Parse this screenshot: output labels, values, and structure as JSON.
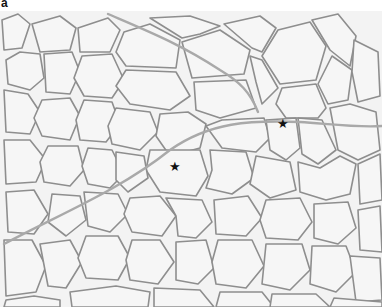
{
  "figure": {
    "panel_label": "a",
    "markers": [
      {
        "symbol": "★",
        "x": 175,
        "y": 166
      },
      {
        "symbol": "★",
        "x": 283,
        "y": 123
      }
    ],
    "colors": {
      "background": "#f2f2f2",
      "cell_fill": "#f4f4f4",
      "membrane": "#8c8c8c",
      "septum": "#a8a8a8",
      "marker": "#111111"
    }
  }
}
